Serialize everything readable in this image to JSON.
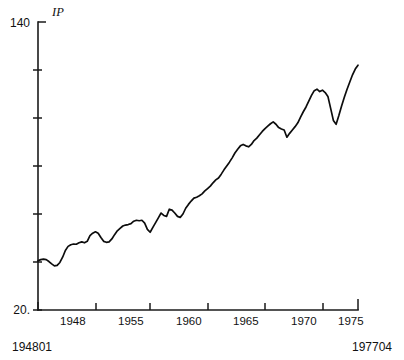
{
  "chart_data": {
    "type": "line",
    "title": "",
    "subtitle": "",
    "series_label": "IP",
    "xlabel": "",
    "ylabel": "",
    "ylim": [
      20,
      140
    ],
    "xlim": [
      "194801",
      "197704"
    ],
    "grid": false,
    "legend_position": "none",
    "y_ticks": [
      20,
      40,
      60,
      80,
      100,
      120,
      140
    ],
    "y_tick_labels_shown": [
      "20.",
      "140"
    ],
    "y_axis_min_label": "20.",
    "y_axis_max_label": "140",
    "x_tick_labels": [
      "1948",
      "1955",
      "1960",
      "1965",
      "1970",
      "1975"
    ],
    "x_start_label": "194801",
    "x_end_label": "197704",
    "annotations": [],
    "x": [
      1948.0,
      1948.25,
      1948.5,
      1948.75,
      1949.0,
      1949.25,
      1949.5,
      1949.75,
      1950.0,
      1950.25,
      1950.5,
      1950.75,
      1951.0,
      1951.25,
      1951.5,
      1951.75,
      1952.0,
      1952.25,
      1952.5,
      1952.75,
      1953.0,
      1953.25,
      1953.5,
      1953.75,
      1954.0,
      1954.25,
      1954.5,
      1954.75,
      1955.0,
      1955.25,
      1955.5,
      1955.75,
      1956.0,
      1956.25,
      1956.5,
      1956.75,
      1957.0,
      1957.25,
      1957.5,
      1957.75,
      1958.0,
      1958.25,
      1958.5,
      1958.75,
      1959.0,
      1959.25,
      1959.5,
      1959.75,
      1960.0,
      1960.25,
      1960.5,
      1960.75,
      1961.0,
      1961.25,
      1961.5,
      1961.75,
      1962.0,
      1962.25,
      1962.5,
      1962.75,
      1963.0,
      1963.25,
      1963.5,
      1963.75,
      1964.0,
      1964.25,
      1964.5,
      1964.75,
      1965.0,
      1965.25,
      1965.5,
      1965.75,
      1966.0,
      1966.25,
      1966.5,
      1966.75,
      1967.0,
      1967.25,
      1967.5,
      1967.75,
      1968.0,
      1968.25,
      1968.5,
      1968.75,
      1969.0,
      1969.25,
      1969.5,
      1969.75,
      1970.0,
      1970.25,
      1970.5,
      1970.75,
      1971.0,
      1971.25,
      1971.5,
      1971.75,
      1972.0,
      1972.25,
      1972.5,
      1972.75,
      1973.0,
      1973.25,
      1973.5,
      1973.75,
      1974.0,
      1974.25,
      1974.5,
      1974.75,
      1975.0,
      1975.25,
      1975.5,
      1975.75,
      1976.0,
      1976.25,
      1976.5,
      1976.75,
      1977.0,
      1977.25
    ],
    "values": [
      40.5,
      41.0,
      41.2,
      41.0,
      40.2,
      39.2,
      38.4,
      38.6,
      39.8,
      42.0,
      44.8,
      46.5,
      47.2,
      47.5,
      47.4,
      48.0,
      48.4,
      48.0,
      48.6,
      51.0,
      52.0,
      52.6,
      52.0,
      50.2,
      48.6,
      48.2,
      48.4,
      49.6,
      51.4,
      53.0,
      54.0,
      55.0,
      55.4,
      55.6,
      56.0,
      57.0,
      57.4,
      57.2,
      57.4,
      56.2,
      53.6,
      52.4,
      54.4,
      56.4,
      58.4,
      60.4,
      59.4,
      59.0,
      62.0,
      61.6,
      60.4,
      59.0,
      58.6,
      60.0,
      62.4,
      64.0,
      65.4,
      66.6,
      67.0,
      67.6,
      68.4,
      69.6,
      70.6,
      71.6,
      73.0,
      74.2,
      75.0,
      76.6,
      78.4,
      80.0,
      81.6,
      83.4,
      85.4,
      87.0,
      88.4,
      89.0,
      88.4,
      88.0,
      89.0,
      90.6,
      91.6,
      93.0,
      94.4,
      95.6,
      96.6,
      97.6,
      98.4,
      97.4,
      96.0,
      95.4,
      95.0,
      92.0,
      93.6,
      95.0,
      96.4,
      98.0,
      100.4,
      102.6,
      104.6,
      107.0,
      109.4,
      111.4,
      112.0,
      111.0,
      111.6,
      110.6,
      109.0,
      104.0,
      99.0,
      97.4,
      101.0,
      105.0,
      108.6,
      112.0,
      115.0,
      118.0,
      120.4,
      122.0
    ]
  }
}
